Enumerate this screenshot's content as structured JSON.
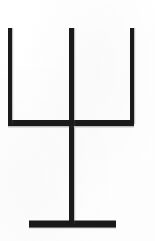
{
  "image": {
    "kind": "scanned-line-drawing",
    "title": "Trident / candelabra symbol",
    "width": 155,
    "height": 241,
    "background_color": "#ffffff",
    "ink_color": "#1a1a1a",
    "caption": ""
  },
  "figure": {
    "name": "trident-symbol",
    "stroke_color": "#1a1a1a",
    "stroke_width": 5,
    "parts": [
      {
        "name": "left-prong",
        "type": "vertical-line",
        "x": 10,
        "y_top": 28,
        "y_bottom": 124,
        "thickness": 4
      },
      {
        "name": "center-prong-stem",
        "type": "vertical-line",
        "x": 71.5,
        "y_top": 28,
        "y_bottom": 224,
        "thickness": 5
      },
      {
        "name": "right-prong",
        "type": "vertical-line",
        "x": 132,
        "y_top": 28,
        "y_bottom": 124,
        "thickness": 4
      },
      {
        "name": "crossbar",
        "type": "horizontal-line",
        "y": 123,
        "x_left": 8,
        "x_right": 134,
        "thickness": 6
      },
      {
        "name": "base-bar",
        "type": "horizontal-line",
        "y": 224,
        "x_left": 29,
        "x_right": 116,
        "thickness": 7
      }
    ]
  }
}
